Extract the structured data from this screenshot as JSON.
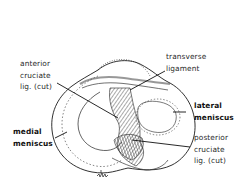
{
  "diagram": {
    "labels": {
      "anterior_cruciate": [
        "anterior",
        "cruciate",
        "lig. (cut)"
      ],
      "transverse_ligament": [
        "transverse",
        "ligament"
      ],
      "lateral_meniscus": [
        "lateral",
        "meniscus"
      ],
      "medial_meniscus": [
        "medial",
        "meniscus"
      ],
      "posterior_cruciate": [
        "posterior",
        "cruciate",
        "lig. (cut)"
      ]
    },
    "signature": "artist signature",
    "colors": {
      "line": "#1a1a1a",
      "shading": "#6e6e6e",
      "background": "#ffffff"
    }
  }
}
